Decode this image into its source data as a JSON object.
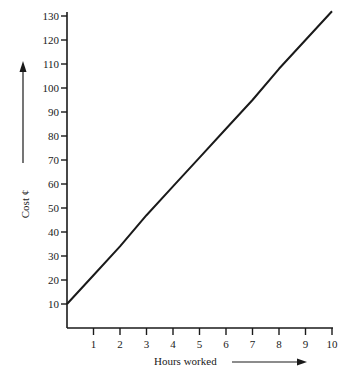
{
  "chart_data": {
    "type": "line",
    "title": "",
    "xlabel": "Hours worked",
    "ylabel": "Cost ¢",
    "xlim": [
      0,
      10
    ],
    "ylim": [
      0,
      130
    ],
    "x_ticks": [
      1,
      2,
      3,
      4,
      5,
      6,
      7,
      8,
      9,
      10
    ],
    "y_ticks": [
      10,
      20,
      30,
      40,
      50,
      60,
      70,
      80,
      90,
      100,
      110,
      120,
      130
    ],
    "grid": false,
    "legend": null,
    "series": [
      {
        "name": "Cost",
        "x": [
          0,
          1,
          2,
          3,
          4,
          5,
          6,
          7,
          8,
          9,
          10
        ],
        "values": [
          10,
          22,
          34,
          47,
          59,
          71,
          83,
          95,
          108,
          120,
          132
        ]
      }
    ],
    "annotations": [
      {
        "type": "arrow",
        "direction": "up",
        "near": "ylabel"
      },
      {
        "type": "arrow",
        "direction": "right",
        "near": "xlabel"
      }
    ]
  }
}
